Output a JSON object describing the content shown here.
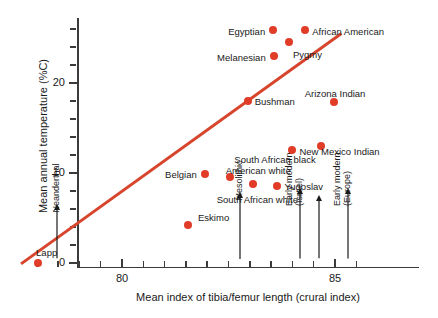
{
  "chart_data": {
    "type": "scatter",
    "title": "",
    "xlabel": "Mean index of tibia/femur length (crural index)",
    "ylabel": "Mean annual temperature (%C)",
    "xlim": [
      77.6,
      85.6
    ],
    "ylim": [
      -0.8,
      27.5
    ],
    "x_ticks_labeled": [
      {
        "value": 80,
        "label": "80"
      },
      {
        "value": 85,
        "label": "85"
      }
    ],
    "y_ticks_labeled": [
      {
        "value": 0,
        "label": "0"
      },
      {
        "value": 10,
        "label": "10"
      },
      {
        "value": 20,
        "label": "20"
      }
    ],
    "grid": false,
    "legend": "none",
    "points": [
      {
        "label": "Lapp",
        "x": 78.03,
        "y": 0.0,
        "label_pos": "above-right"
      },
      {
        "label": "Eskimo",
        "x": 81.55,
        "y": 4.2,
        "label_pos": "left"
      },
      {
        "label": "Belgian",
        "x": 81.95,
        "y": 9.9,
        "label_pos": "left"
      },
      {
        "label": "South African white",
        "x": 83.08,
        "y": 8.8,
        "label_pos": "below"
      },
      {
        "label": "American white",
        "x": 82.53,
        "y": 9.6,
        "label_pos": "above-right"
      },
      {
        "label": "Yugoslav",
        "x": 83.65,
        "y": 8.6,
        "label_pos": "right"
      },
      {
        "label": "Bushman",
        "x": 82.95,
        "y": 18.0,
        "label_pos": "right"
      },
      {
        "label": "South African black",
        "x": 84.68,
        "y": 13.0,
        "label_pos": "left"
      },
      {
        "label": "New Mexico Indian",
        "x": 84.0,
        "y": 12.6,
        "label_pos": "right"
      },
      {
        "label": "Arizona Indian",
        "x": 84.98,
        "y": 17.9,
        "label_pos": "above"
      },
      {
        "label": "Melanesian",
        "x": 83.57,
        "y": 23.0,
        "label_pos": "left"
      },
      {
        "label": "Egyptian",
        "x": 83.55,
        "y": 25.9,
        "label_pos": "left"
      },
      {
        "label": "Pygmy",
        "x": 83.92,
        "y": 24.6,
        "label_pos": "right"
      },
      {
        "label": "African American",
        "x": 84.3,
        "y": 25.9,
        "label_pos": "right"
      }
    ],
    "trend_line": {
      "x_start": 77.63,
      "y_start": -0.1,
      "x_end": 85.15,
      "y_end": 25.5,
      "color": "#d6452c"
    },
    "annotations": [
      {
        "label": "Neanderthal",
        "label2": "",
        "x": 78.47,
        "arrow_from_y": 0.5,
        "arrow_to_y": 6.2
      },
      {
        "label": "Mesolithic",
        "label2": "",
        "x": 82.77,
        "arrow_from_y": 0.5,
        "arrow_to_y": 7.6
      },
      {
        "label": "Early modern",
        "label2": "(Israel)",
        "x": 84.18,
        "arrow_from_y": 0.5,
        "arrow_to_y": 8.0
      },
      {
        "label": "",
        "label2": "",
        "x": 84.62,
        "arrow_from_y": 0.5,
        "arrow_to_y": 7.2
      },
      {
        "label": "Early modern",
        "label2": "(Europe)",
        "x": 85.3,
        "arrow_from_y": 0.5,
        "arrow_to_y": 8.0
      }
    ]
  },
  "colors": {
    "marker": "#e03c28",
    "line": "#d6452c",
    "axis": "#3b3b3b",
    "text": "#1a1a1a",
    "background": "#ffffff"
  }
}
